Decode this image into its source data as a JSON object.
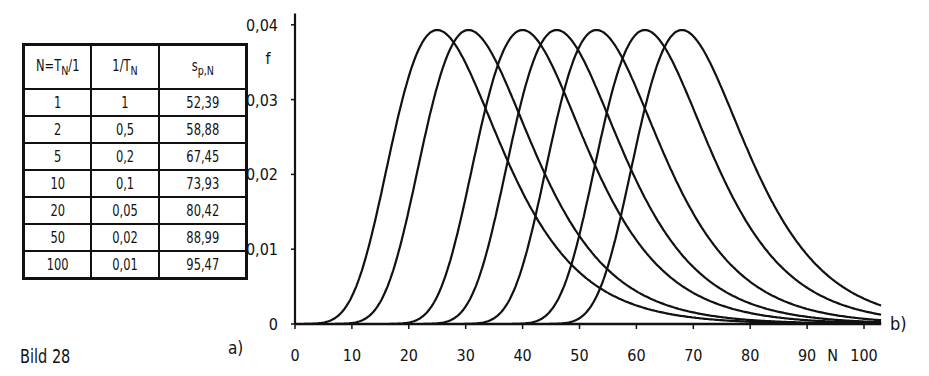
{
  "table": {
    "headers": [
      "N=T_N/1",
      "1/T_N",
      "s_p,N"
    ],
    "rows": [
      [
        "1",
        "1",
        "52,39"
      ],
      [
        "2",
        "0,5",
        "58,88"
      ],
      [
        "5",
        "0,2",
        "67,45"
      ],
      [
        "10",
        "0,1",
        "73,93"
      ],
      [
        "20",
        "0,05",
        "80,42"
      ],
      [
        "50",
        "0,02",
        "88,99"
      ],
      [
        "100",
        "0,01",
        "95,47"
      ]
    ],
    "label": "a)"
  },
  "caption": "Bild 28",
  "chart_data": {
    "type": "line",
    "title": "",
    "xlabel": "N",
    "ylabel": "f",
    "xlim": [
      0,
      103
    ],
    "ylim": [
      0,
      0.04
    ],
    "xticks": [
      0,
      10,
      20,
      30,
      40,
      50,
      60,
      70,
      80,
      90,
      100
    ],
    "xtick_labels": [
      "0",
      "10",
      "20",
      "30",
      "40",
      "50",
      "60",
      "70",
      "80",
      "90",
      "100"
    ],
    "yticks": [
      0,
      0.01,
      0.02,
      0.03,
      0.04
    ],
    "ytick_labels": [
      "0",
      "0,01",
      "0,02",
      "0,03",
      "0,04"
    ],
    "grid": false,
    "panel_label": "b)",
    "curve_family": "Gumbel (extreme value) density",
    "scale_beta": 9.36,
    "peak_f": 0.0393,
    "series": [
      {
        "name": "curve 1",
        "mode": 25
      },
      {
        "name": "curve 2",
        "mode": 30.5
      },
      {
        "name": "curve 3",
        "mode": 40
      },
      {
        "name": "curve 4",
        "mode": 46
      },
      {
        "name": "curve 5",
        "mode": 53
      },
      {
        "name": "curve 6",
        "mode": 61.5
      },
      {
        "name": "curve 7",
        "mode": 68
      }
    ]
  }
}
